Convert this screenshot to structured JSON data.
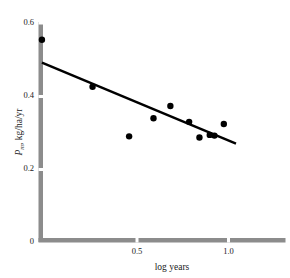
{
  "chart_data": {
    "type": "scatter",
    "title": "",
    "xlabel": "log years",
    "ylabel": "P_m, kg/ha/yr",
    "ylabel_symbol": "P",
    "ylabel_subscript": "m",
    "ylabel_rest": ", kg/ha/yr",
    "xlim": [
      0,
      1.27
    ],
    "ylim": [
      0,
      0.6
    ],
    "xticks": [
      0.5,
      1.0
    ],
    "xticklabels": [
      "0.5",
      "1.0"
    ],
    "yticks": [
      0,
      0.2,
      0.4,
      0.6
    ],
    "yticklabels": [
      "0",
      "0.2",
      "0.4",
      "0.6"
    ],
    "grid": false,
    "legend": null,
    "marker": "filled-circle",
    "marker_color": "#000000",
    "axis_color": "#8c8c8c",
    "line_color": "#000000",
    "points": [
      {
        "x": 0.005,
        "y": 0.555
      },
      {
        "x": 0.275,
        "y": 0.425
      },
      {
        "x": 0.47,
        "y": 0.288
      },
      {
        "x": 0.6,
        "y": 0.338
      },
      {
        "x": 0.69,
        "y": 0.372
      },
      {
        "x": 0.79,
        "y": 0.328
      },
      {
        "x": 0.845,
        "y": 0.285
      },
      {
        "x": 0.9,
        "y": 0.292
      },
      {
        "x": 0.925,
        "y": 0.29
      },
      {
        "x": 0.975,
        "y": 0.322
      }
    ],
    "fit_line": {
      "x0": 0.005,
      "y0": 0.492,
      "x1": 1.04,
      "y1": 0.268
    }
  },
  "figure": {
    "caption": ""
  }
}
